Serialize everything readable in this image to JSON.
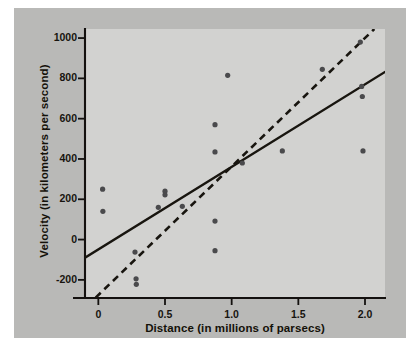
{
  "figure": {
    "background_color": "#b9b9b7",
    "panel_color": "#d2d2d0",
    "page_color": "#ffffff"
  },
  "chart_data": {
    "type": "scatter",
    "title": "",
    "xlabel": "Distance (in millions of parsecs)",
    "ylabel": "Velocity (in kilometers per second)",
    "xlim": [
      -0.1,
      2.15
    ],
    "ylim": [
      -290,
      1045
    ],
    "xticks": [
      0,
      0.5,
      1.0,
      1.5,
      2.0
    ],
    "xtick_labels": [
      "0",
      "0.5",
      "1.0",
      "1.5",
      "2.0"
    ],
    "yticks": [
      -200,
      0,
      200,
      400,
      600,
      800,
      1000
    ],
    "ytick_labels": [
      "-200",
      "0",
      "200",
      "400",
      "600",
      "800",
      "1000"
    ],
    "grid": false,
    "legend": false,
    "point_color": "#4a4a4c",
    "line_color": "#18150f",
    "points": [
      {
        "x": 0.032,
        "y": 250
      },
      {
        "x": 0.034,
        "y": 140
      },
      {
        "x": 0.275,
        "y": -62
      },
      {
        "x": 0.283,
        "y": -195
      },
      {
        "x": 0.285,
        "y": -222
      },
      {
        "x": 0.45,
        "y": 160
      },
      {
        "x": 0.5,
        "y": 240
      },
      {
        "x": 0.5,
        "y": 222
      },
      {
        "x": 0.63,
        "y": 165
      },
      {
        "x": 0.875,
        "y": 570
      },
      {
        "x": 0.875,
        "y": 435
      },
      {
        "x": 0.875,
        "y": 92
      },
      {
        "x": 0.875,
        "y": -55
      },
      {
        "x": 0.97,
        "y": 815
      },
      {
        "x": 1.08,
        "y": 380
      },
      {
        "x": 1.38,
        "y": 440
      },
      {
        "x": 1.68,
        "y": 845
      },
      {
        "x": 1.965,
        "y": 980
      },
      {
        "x": 1.975,
        "y": 760
      },
      {
        "x": 1.98,
        "y": 710
      },
      {
        "x": 1.985,
        "y": 440
      }
    ],
    "series": [
      {
        "name": "solid-regression-line",
        "style": "solid",
        "x_start": -0.1,
        "y_start": -90,
        "x_end": 2.15,
        "y_end": 832
      },
      {
        "name": "dashed-regression-line",
        "style": "dashed",
        "x_start": -0.02,
        "y_start": -288,
        "x_end": 2.07,
        "y_end": 1045
      }
    ]
  }
}
